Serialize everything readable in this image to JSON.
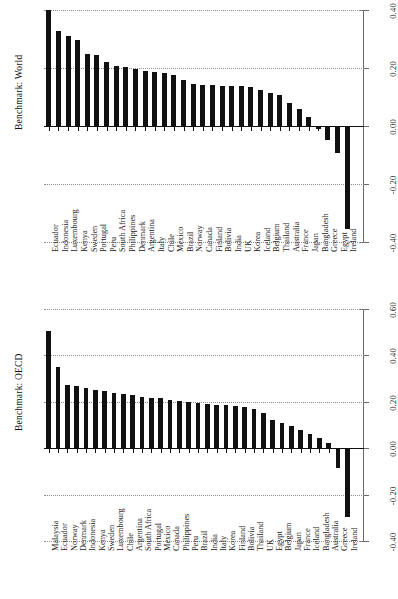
{
  "figure": {
    "orientation": "rotated-90",
    "background": "#ffffff",
    "bar_color": "#111111",
    "grid_color": "#8d8d8d",
    "axis_color": "#6a6a6a"
  },
  "panels": [
    {
      "id": "world",
      "title": "Benchmark: World"
    },
    {
      "id": "oecd",
      "title": "Benchmark: OECD"
    }
  ],
  "chart_data": [
    {
      "type": "bar",
      "title": "Benchmark: World",
      "xlabel": "",
      "ylabel": "Benchmark: World",
      "ylim": [
        -0.4,
        0.4
      ],
      "yticks": [
        "0.40",
        "0.20",
        "0.00",
        "-0.20",
        "-0.40"
      ],
      "ytick_values": [
        0.4,
        0.2,
        0.0,
        -0.2,
        -0.4
      ],
      "grid": true,
      "legend": "none",
      "orientation": "vertical-bars-rotated",
      "categories": [
        "Ecuador",
        "Indonesia",
        "Luxembourg",
        "Kenya",
        "Sweden",
        "Portugal",
        "Peru",
        "South Africa",
        "Philippines",
        "Denmark",
        "Argentina",
        "Italy",
        "Chile",
        "Mexico",
        "Brazil",
        "Norway",
        "Canada",
        "Finland",
        "Bolivia",
        "India",
        "UK",
        "Korea",
        "Iceland",
        "Belgium",
        "Thailand",
        "Australia",
        "France",
        "Japan",
        "Bangladesh",
        "Greece",
        "Egypt",
        "Ireland"
      ],
      "values": [
        0.4,
        0.327,
        0.312,
        0.297,
        0.248,
        0.245,
        0.222,
        0.206,
        0.204,
        0.195,
        0.19,
        0.185,
        0.182,
        0.175,
        0.16,
        0.145,
        0.142,
        0.142,
        0.138,
        0.138,
        0.138,
        0.133,
        0.123,
        0.113,
        0.106,
        0.078,
        0.06,
        0.03,
        -0.012,
        -0.048,
        -0.093,
        -0.355
      ]
    },
    {
      "type": "bar",
      "title": "Benchmark: OECD",
      "xlabel": "",
      "ylabel": "Benchmark: OECD",
      "ylim": [
        -0.4,
        0.6
      ],
      "yticks": [
        "0.60",
        "0.40",
        "0.20",
        "0.00",
        "-0.20",
        "-0.40"
      ],
      "ytick_values": [
        0.6,
        0.4,
        0.2,
        0.0,
        -0.2,
        -0.4
      ],
      "grid": true,
      "legend": "none",
      "orientation": "vertical-bars-rotated",
      "categories": [
        "Malaysia",
        "Ecuador",
        "Norway",
        "Denmark",
        "Indonesia",
        "Kenya",
        "Sweden",
        "Luxembourg",
        "Chile",
        "Argentina",
        "South Africa",
        "Portugal",
        "Mexico",
        "Canada",
        "Philippines",
        "Peru",
        "Brazil",
        "India",
        "Italy",
        "Korea",
        "Finland",
        "Bolivia",
        "Thailand",
        "UK",
        "Egypt",
        "Belgium",
        "Japan",
        "France",
        "Iceland",
        "Bangladesh",
        "Australia",
        "Greece",
        "Ireland"
      ],
      "values": [
        0.505,
        0.348,
        0.272,
        0.268,
        0.258,
        0.252,
        0.248,
        0.24,
        0.232,
        0.228,
        0.222,
        0.218,
        0.215,
        0.208,
        0.205,
        0.2,
        0.196,
        0.192,
        0.188,
        0.186,
        0.182,
        0.178,
        0.17,
        0.15,
        0.12,
        0.11,
        0.095,
        0.08,
        0.062,
        0.045,
        0.022,
        -0.085,
        -0.295
      ]
    }
  ]
}
